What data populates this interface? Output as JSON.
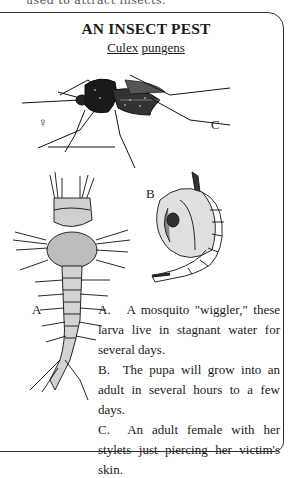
{
  "header_cutoff_text": "used to attract insects.",
  "panel": {
    "title": "AN INSECT PEST",
    "scientific_name": {
      "genus": "Culex",
      "species": "pungens"
    }
  },
  "figures": {
    "adult": {
      "label": "C",
      "sex_symbol": "♀"
    },
    "pupa": {
      "label": "B"
    },
    "larva": {
      "label": "A"
    }
  },
  "descriptions": [
    {
      "key": "A.",
      "text": "A mosquito \"wiggler,\" these larva live in stagnant water for several days."
    },
    {
      "key": "B.",
      "text": "The pupa will grow into an adult in several hours to a few days."
    },
    {
      "key": "C.",
      "text": "An adult female with her stylets just piercing her victim's skin."
    }
  ]
}
